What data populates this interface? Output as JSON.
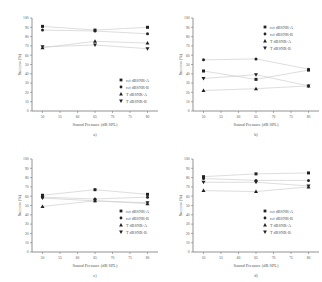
{
  "chart_data": [
    {
      "type": "scatter",
      "panel_label": "a)",
      "xlabel": "Sound Pressure (dB SPL)",
      "ylabel": "Success (%)",
      "x": [
        50,
        65,
        80
      ],
      "xticks": [
        50,
        55,
        60,
        65,
        70,
        75,
        80
      ],
      "yticks": [
        0,
        10,
        20,
        30,
        40,
        50,
        60,
        70,
        80,
        90,
        100
      ],
      "ylim": [
        0,
        100
      ],
      "xlim": [
        47,
        83
      ],
      "legend_position": "lower right",
      "series": [
        {
          "name": "ref dBSNR-A",
          "marker": "square",
          "values": [
            91,
            87,
            90
          ]
        },
        {
          "name": "ref dBSNR-B",
          "marker": "circle",
          "values": [
            87,
            86,
            83
          ]
        },
        {
          "name": "T dBSNR-A",
          "marker": "triangle-up",
          "values": [
            68,
            75,
            73
          ]
        },
        {
          "name": "T dBSNR-B",
          "marker": "triangle-down",
          "values": [
            69,
            71,
            67
          ]
        }
      ]
    },
    {
      "type": "scatter",
      "panel_label": "b)",
      "xlabel": "Sound Pressure (dB SPL)",
      "ylabel": "Success (%)",
      "x": [
        50,
        65,
        80
      ],
      "xticks": [
        50,
        55,
        60,
        65,
        70,
        75,
        80
      ],
      "yticks": [
        0,
        10,
        20,
        30,
        40,
        50,
        60,
        70,
        80,
        90,
        100
      ],
      "ylim": [
        0,
        100
      ],
      "xlim": [
        47,
        83
      ],
      "legend_position": "upper right",
      "series": [
        {
          "name": "ref dBSNR-A",
          "marker": "square",
          "values": [
            43,
            34,
            44
          ]
        },
        {
          "name": "ref dBSNR-B",
          "marker": "circle",
          "values": [
            55,
            56,
            45
          ]
        },
        {
          "name": "T dBSNR-A",
          "marker": "triangle-up",
          "values": [
            22,
            24,
            27
          ]
        },
        {
          "name": "T dBSNR-B",
          "marker": "triangle-down",
          "values": [
            35,
            39,
            27
          ]
        }
      ]
    },
    {
      "type": "scatter",
      "panel_label": "c)",
      "xlabel": "Sound Pressure (dB SPL)",
      "ylabel": "Success (%)",
      "x": [
        50,
        65,
        80
      ],
      "xticks": [
        50,
        55,
        60,
        65,
        70,
        75,
        80
      ],
      "yticks": [
        0,
        10,
        20,
        30,
        40,
        50,
        60,
        70,
        80,
        90,
        100
      ],
      "ylim": [
        0,
        100
      ],
      "xlim": [
        47,
        83
      ],
      "legend_position": "lower right",
      "series": [
        {
          "name": "ref dBSNR-A",
          "marker": "square",
          "values": [
            61,
            67,
            62
          ]
        },
        {
          "name": "ref dBSNR-B",
          "marker": "circle",
          "values": [
            59,
            57,
            59
          ]
        },
        {
          "name": "T dBSNR-A",
          "marker": "triangle-up",
          "values": [
            49,
            55,
            52
          ]
        },
        {
          "name": "T dBSNR-B",
          "marker": "triangle-down",
          "values": [
            58,
            55,
            53
          ]
        }
      ]
    },
    {
      "type": "scatter",
      "panel_label": "d)",
      "xlabel": "Sound Pressure (dB SPL)",
      "ylabel": "Success (%)",
      "x": [
        50,
        65,
        80
      ],
      "xticks": [
        50,
        55,
        60,
        65,
        70,
        75,
        80
      ],
      "yticks": [
        0,
        10,
        20,
        30,
        40,
        50,
        60,
        70,
        80,
        90,
        100
      ],
      "ylim": [
        0,
        100
      ],
      "xlim": [
        47,
        83
      ],
      "legend_position": "lower right",
      "series": [
        {
          "name": "ref dBSNR-A",
          "marker": "square",
          "values": [
            81,
            84,
            85
          ]
        },
        {
          "name": "ref dBSNR-B",
          "marker": "circle",
          "values": [
            79,
            77,
            77
          ]
        },
        {
          "name": "T dBSNR-A",
          "marker": "triangle-up",
          "values": [
            66,
            65,
            70
          ]
        },
        {
          "name": "T dBSNR-B",
          "marker": "triangle-down",
          "values": [
            75,
            75,
            71
          ]
        }
      ]
    }
  ],
  "style": {
    "axis_color": "#777777",
    "line_color": "#cfcfcf",
    "marker_color": "#222222",
    "text_color": "#555555"
  }
}
